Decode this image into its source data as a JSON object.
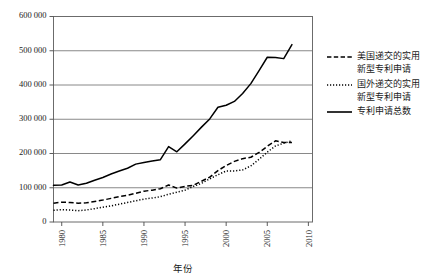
{
  "chart_data": {
    "type": "line",
    "title": "",
    "xlabel": "年份",
    "ylabel": "",
    "xlim": [
      1979,
      2010.5
    ],
    "ylim": [
      0,
      600000
    ],
    "grid": true,
    "legend_position": "right",
    "y_ticks": [
      "0",
      "100 000",
      "200 000",
      "300 000",
      "400 000",
      "500 000",
      "600 000"
    ],
    "y_tick_values": [
      0,
      100000,
      200000,
      300000,
      400000,
      500000,
      600000
    ],
    "x_ticks": [
      "1980",
      "1985",
      "1990",
      "1995",
      "2000",
      "2005",
      "2010"
    ],
    "x_tick_values": [
      1980,
      1985,
      1990,
      1995,
      2000,
      2005,
      2010
    ],
    "x": [
      1979,
      1980,
      1981,
      1982,
      1983,
      1984,
      1985,
      1986,
      1987,
      1988,
      1989,
      1990,
      1991,
      1992,
      1993,
      1994,
      1995,
      1996,
      1997,
      1998,
      1999,
      2000,
      2001,
      2002,
      2003,
      2004,
      2005,
      2006,
      2007,
      2008
    ],
    "series": [
      {
        "name": "美国递交的实用新型专利申请",
        "style": "dashed",
        "color": "#000000",
        "values": [
          55000,
          58000,
          57000,
          55000,
          56000,
          60000,
          64000,
          69000,
          74000,
          78000,
          84000,
          90000,
          93000,
          97000,
          108000,
          99000,
          104000,
          107000,
          119000,
          131000,
          150000,
          165000,
          177000,
          185000,
          189000,
          203000,
          221000,
          237000,
          232000,
          232000
        ]
      },
      {
        "name": "国外递交的实用新型专利申请",
        "style": "dotted",
        "color": "#000000",
        "values": [
          34000,
          36000,
          35000,
          33000,
          35000,
          39000,
          43000,
          47000,
          52000,
          57000,
          62000,
          67000,
          70000,
          74000,
          81000,
          87000,
          93000,
          104000,
          113000,
          126000,
          138000,
          149000,
          149000,
          152000,
          164000,
          183000,
          204000,
          222000,
          230000,
          237000
        ]
      },
      {
        "name": "专利申请总数",
        "style": "solid",
        "color": "#000000",
        "values": [
          107000,
          108000,
          117000,
          108000,
          113000,
          122000,
          130000,
          140000,
          149000,
          157000,
          169000,
          174000,
          178000,
          182000,
          220000,
          205000,
          228000,
          252000,
          277000,
          301000,
          335000,
          341000,
          352000,
          375000,
          404000,
          442000,
          481000,
          480000,
          477000,
          518000
        ]
      }
    ],
    "legend": [
      {
        "label_line1": "美国递交的实用",
        "label_line2": "新型专利申请",
        "style": "dashed"
      },
      {
        "label_line1": "国外递交的实用",
        "label_line2": "新型专利申请",
        "style": "dotted"
      },
      {
        "label_line1": "专利申请总数",
        "label_line2": "",
        "style": "solid"
      }
    ],
    "caption": ""
  }
}
